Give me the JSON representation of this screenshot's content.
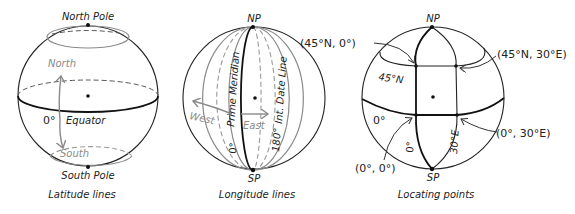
{
  "figures": [
    {
      "caption": "Latitude lines",
      "labels": {
        "north_pole": "North Pole",
        "south_pole": "South Pole",
        "north": "North",
        "south": "South",
        "zero_degree": "0°",
        "equator": "Equator"
      }
    },
    {
      "caption": "Longitude lines",
      "labels": {
        "north_pole": "NP",
        "south_pole": "SP",
        "prime_meridian": "Prime Meridian",
        "zero_degree": "0°",
        "international_date_line": "Int. Date Line",
        "one_eighty_degree": "180°",
        "west": "West",
        "east": "East"
      }
    },
    {
      "caption": "Locating points",
      "labels": {
        "north_pole": "NP",
        "south_pole": "SP",
        "lat_45n": "45°N",
        "zero_lat": "0°",
        "zero_lon": "0°",
        "lon_30e": "30°E",
        "point_45n_0": "(45°N, 0°)",
        "point_45n_30e": "(45°N, 30°E)",
        "point_0_0": "(0°, 0°)",
        "point_0_30e": "(0°, 30°E)"
      }
    }
  ],
  "colors": {
    "line": "#222222",
    "secondary": "#8a8a8a",
    "background": "#ffffff"
  }
}
